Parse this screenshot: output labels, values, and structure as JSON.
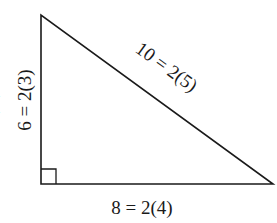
{
  "diagram": {
    "type": "right-triangle",
    "vertices": {
      "top": [
        41,
        15
      ],
      "right_angle": [
        41,
        184
      ],
      "right": [
        273,
        184
      ]
    },
    "right_angle_marker": {
      "x": 41,
      "y": 169,
      "size": 15
    },
    "stroke_color": "#1a1a1a",
    "labels": {
      "vertical_leg": "6 = 2(3)",
      "horizontal_leg": "8 = 2(4)",
      "hypotenuse": "10 = 2(5)"
    },
    "edge_artifact": "("
  }
}
